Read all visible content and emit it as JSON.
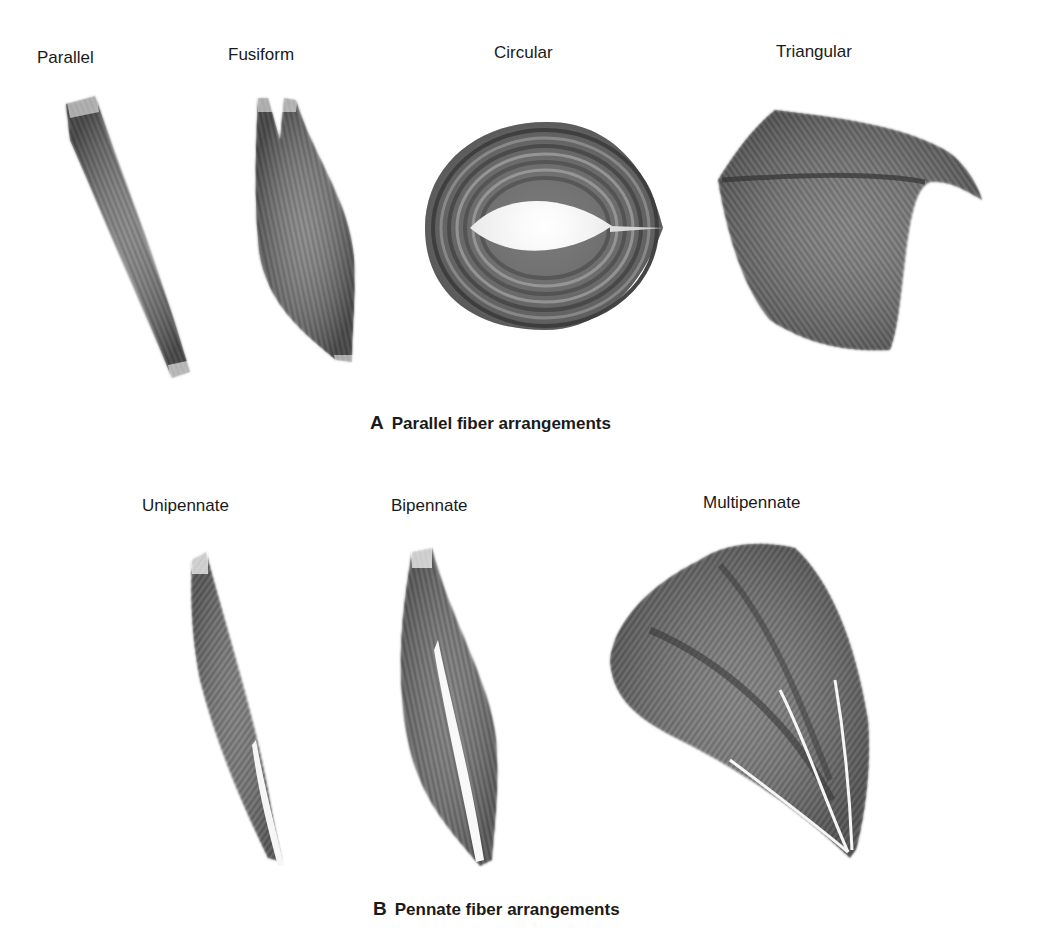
{
  "section_a": {
    "letter": "A",
    "title": "Parallel fiber arrangements",
    "items": [
      {
        "label": "Parallel"
      },
      {
        "label": "Fusiform"
      },
      {
        "label": "Circular"
      },
      {
        "label": "Triangular"
      }
    ]
  },
  "section_b": {
    "letter": "B",
    "title": "Pennate fiber arrangements",
    "items": [
      {
        "label": "Unipennate"
      },
      {
        "label": "Bipennate"
      },
      {
        "label": "Multipennate"
      }
    ]
  },
  "colors": {
    "muscle_dark": "#3a3a3a",
    "muscle_mid": "#6e6e6e",
    "muscle_light": "#a8a8a8",
    "tendon": "#f4f4f4",
    "text": "#1a1a1a"
  }
}
